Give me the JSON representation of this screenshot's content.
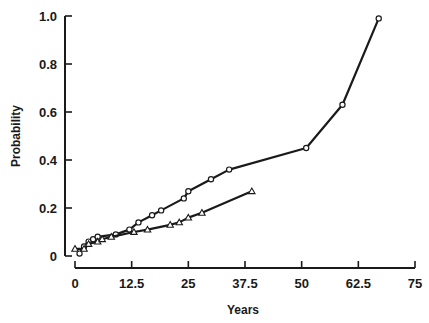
{
  "chart_data": {
    "type": "line",
    "title": "",
    "xlabel": "Years",
    "ylabel": "Probability",
    "xlim": [
      0,
      75
    ],
    "ylim": [
      0,
      1.0
    ],
    "x_ticks": [
      "0",
      "12.5",
      "25",
      "37.5",
      "50",
      "62.5",
      "75"
    ],
    "x_tick_values": [
      0,
      12.5,
      25,
      37.5,
      50,
      62.5,
      75
    ],
    "y_ticks": [
      "0",
      "0.2",
      "0.4",
      "0.6",
      "0.8",
      "1.0"
    ],
    "y_tick_values": [
      0,
      0.2,
      0.4,
      0.6,
      0.8,
      1.0
    ],
    "grid": false,
    "legend": null,
    "series": [
      {
        "name": "circles",
        "marker": "circle",
        "x": [
          1,
          2,
          3,
          4,
          5,
          9,
          12,
          14,
          17,
          19,
          24,
          25,
          30,
          34,
          51,
          59,
          67
        ],
        "values": [
          0.01,
          0.04,
          0.06,
          0.07,
          0.08,
          0.09,
          0.11,
          0.14,
          0.17,
          0.19,
          0.24,
          0.27,
          0.32,
          0.36,
          0.45,
          0.63,
          0.99
        ]
      },
      {
        "name": "triangles",
        "marker": "triangle",
        "x": [
          0,
          2,
          3,
          5,
          6,
          8,
          13,
          16,
          21,
          23,
          25,
          28,
          39
        ],
        "values": [
          0.03,
          0.03,
          0.05,
          0.06,
          0.07,
          0.08,
          0.1,
          0.11,
          0.13,
          0.14,
          0.16,
          0.18,
          0.27
        ]
      }
    ]
  },
  "colors": {
    "ink": "#1a1a1a",
    "background": "#ffffff"
  }
}
